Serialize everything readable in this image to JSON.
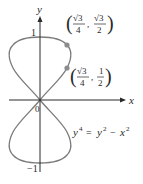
{
  "figure": {
    "axes": {
      "x_label": "x",
      "y_label": "y",
      "origin_label": "0",
      "tick_top_label": "1",
      "tick_bottom_label": "−1"
    },
    "equation": {
      "lhs_base": "y",
      "lhs_exp": "4",
      "equals": "=",
      "rhs_term1_base": "y",
      "rhs_term1_exp": "2",
      "minus": "−",
      "rhs_term2_base": "x",
      "rhs_term2_exp": "2"
    },
    "points": [
      {
        "x_num": "√3",
        "x_den": "4",
        "y_num": "√3",
        "y_den": "2",
        "x_value": 0.433,
        "y_value": 0.866
      },
      {
        "x_num": "√3",
        "x_den": "4",
        "y_num": "1",
        "y_den": "2",
        "x_value": 0.433,
        "y_value": 0.5
      }
    ],
    "colors": {
      "curve": "#7a7a7a",
      "axis": "#2a2a2a",
      "point": "#8c8c8c",
      "text": "#2a2a2a"
    }
  }
}
